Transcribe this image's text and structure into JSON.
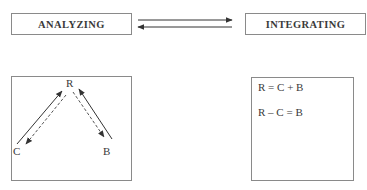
{
  "top_row": {
    "left_box": {
      "label": "ANALYZING"
    },
    "right_box": {
      "label": "INTEGRATING"
    },
    "arrows": [
      {
        "direction": "right",
        "from": "ANALYZING",
        "to": "INTEGRATING"
      },
      {
        "direction": "left",
        "from": "INTEGRATING",
        "to": "ANALYZING"
      }
    ]
  },
  "analysis_diagram": {
    "nodes": {
      "r": "R",
      "c": "C",
      "b": "B"
    },
    "edges": [
      {
        "from": "C",
        "to": "R",
        "style": "solid"
      },
      {
        "from": "R",
        "to": "C",
        "style": "dashed"
      },
      {
        "from": "B",
        "to": "R",
        "style": "solid"
      },
      {
        "from": "R",
        "to": "B",
        "style": "dashed"
      }
    ]
  },
  "integration_panel": {
    "equations": [
      "R = C + B",
      "R – C = B"
    ]
  },
  "colors": {
    "border": "#8a8a8a",
    "line": "#333333",
    "text": "#3a3a3a"
  }
}
